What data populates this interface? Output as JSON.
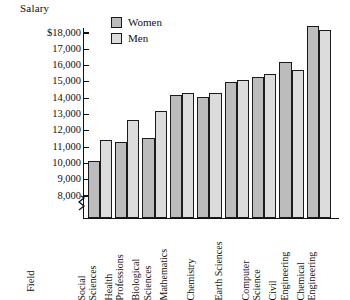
{
  "chart_data": {
    "type": "bar",
    "title": "",
    "ylabel": "Salary",
    "xlabel": "Field",
    "ylim": [
      8000,
      18500
    ],
    "axis_break": true,
    "grid": false,
    "legend_position": "top-center",
    "ytick_labels": [
      "$18,000",
      "17,000",
      "16,000",
      "15,000",
      "14,000",
      "13,000",
      "12,000",
      "11,000",
      "10,000",
      "9,000",
      "8,000"
    ],
    "ytick_values": [
      18000,
      17000,
      16000,
      15000,
      14000,
      13000,
      12000,
      11000,
      10000,
      9000,
      8000
    ],
    "categories": [
      "Social Sciences",
      "Health Professions",
      "Biological Sciences",
      "Mathematics",
      "Chemistry",
      "Earth Sciences",
      "Computer Science",
      "Civil Engineering",
      "Chemical Engineering"
    ],
    "category_lines": [
      [
        "Social",
        "Sciences"
      ],
      [
        "Health",
        "Professions"
      ],
      [
        "Biological",
        "Sciences"
      ],
      [
        "Mathematics"
      ],
      [
        "Chemistry"
      ],
      [
        "Earth Sciences"
      ],
      [
        "Computer",
        "Science"
      ],
      [
        "Civil",
        "Engineering"
      ],
      [
        "Chemical",
        "Engineering"
      ]
    ],
    "series": [
      {
        "name": "Women",
        "color": "#bcbcbc",
        "values": [
          10150,
          11300,
          11550,
          14200,
          14100,
          15000,
          15300,
          16200,
          18400
        ]
      },
      {
        "name": "Men",
        "color": "#dcdcdc",
        "values": [
          11450,
          12650,
          13200,
          14300,
          14300,
          15100,
          15500,
          15700,
          18200
        ]
      }
    ]
  },
  "legend": {
    "items": [
      {
        "label": "Women",
        "swatch_color": "#bcbcbc"
      },
      {
        "label": "Men",
        "swatch_color": "#dcdcdc"
      }
    ]
  },
  "axes": {
    "y_title": "Salary",
    "x_title": "Field"
  }
}
